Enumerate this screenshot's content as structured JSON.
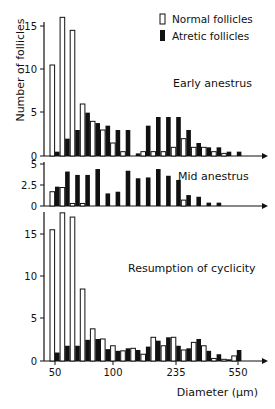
{
  "chart_data": {
    "type": "bar",
    "title": "",
    "xlabel": "Diameter (µm)",
    "ylabel": "Number of follicles",
    "x_tick_labels": [
      "50",
      "100",
      "235",
      "550"
    ],
    "legend": {
      "position": "top-right",
      "entries": [
        {
          "name": "Normal follicles",
          "style": "open"
        },
        {
          "name": "Atretic follicles",
          "style": "filled"
        }
      ]
    },
    "bins": 20,
    "panels": [
      {
        "name": "Early anestrus",
        "ylim": [
          0,
          15
        ],
        "yticks": [
          "0",
          "5",
          "10",
          "15"
        ],
        "series": [
          {
            "name": "Normal follicles",
            "values": [
              10.5,
              16,
              14.5,
              6,
              4,
              3,
              1.5,
              0.5,
              0,
              0.5,
              0.5,
              0.5,
              1,
              2,
              1,
              1,
              0.5,
              0.3,
              0,
              0
            ]
          },
          {
            "name": "Atretic follicles",
            "values": [
              0.5,
              2,
              3,
              5,
              3.8,
              3.5,
              3,
              3,
              0.3,
              3.5,
              4.5,
              4.5,
              4.5,
              3,
              1.5,
              1,
              1,
              0.5,
              0.5,
              0
            ]
          }
        ]
      },
      {
        "name": "Mid anestrus",
        "ylim": [
          0,
          5
        ],
        "yticks": [
          "0",
          "2.5",
          "5"
        ],
        "series": [
          {
            "name": "Normal follicles",
            "values": [
              1.7,
              2.2,
              0.3,
              0.3,
              0,
              0,
              0,
              0,
              0,
              0,
              0,
              0,
              0,
              0.7,
              0,
              0,
              0,
              0,
              0,
              0
            ]
          },
          {
            "name": "Atretic follicles",
            "values": [
              2.3,
              4.1,
              3.7,
              3.7,
              4.4,
              1.5,
              1.7,
              4.2,
              3.3,
              3.4,
              4.4,
              3.6,
              3.1,
              1.3,
              1.1,
              0.4,
              0.4,
              0,
              0,
              0
            ]
          }
        ]
      },
      {
        "name": "Resumption of cyclicity",
        "ylim": [
          0,
          15
        ],
        "yticks": [
          "0",
          "5",
          "10",
          "15"
        ],
        "series": [
          {
            "name": "Normal follicles",
            "values": [
              15.5,
              17.5,
              17,
              8.5,
              3.8,
              2.6,
              1.8,
              1.2,
              1.5,
              0.8,
              2.8,
              1.8,
              2.8,
              1.3,
              2.2,
              1.8,
              0.3,
              0.2,
              0.6,
              0
            ]
          },
          {
            "name": "Atretic follicles",
            "values": [
              1,
              1.8,
              1.8,
              2.5,
              2.6,
              1.4,
              1.2,
              1.5,
              1.3,
              1.7,
              2.4,
              2.8,
              1.8,
              1.5,
              2.6,
              1.2,
              0.8,
              0.2,
              1.3,
              0
            ]
          }
        ]
      }
    ]
  }
}
